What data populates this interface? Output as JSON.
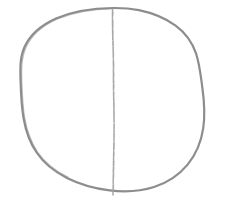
{
  "figure": {
    "background_color": "#ffffff",
    "width": 227,
    "height": 210
  },
  "strokes": {
    "outline": {
      "name": "circle-outline",
      "color": "#878787",
      "width": 2.2,
      "opacity": 0.95,
      "path": "M 113.0 8.0 C 92.0 8.2 72.0 11.5 56.0 18.5 C 41.0 25.2 30.0 35.0 24.5 47.0 C 19.6 57.8 20.2 70.0 20.6 82.0 C 21.0 94.5 21.6 107.0 23.6 118.5 C 25.8 131.0 29.8 142.5 36.6 152.5 C 44.0 163.4 54.6 171.8 67.0 178.0 C 79.8 184.4 94.4 188.6 109.6 190.4 C 124.8 192.2 140.2 191.4 154.0 187.0 C 167.4 182.8 179.0 175.0 187.6 164.6 C 196.0 154.4 201.2 141.8 203.2 128.4 C 205.2 115.0 204.2 101.0 202.4 88.0 C 200.7 75.6 199.6 64.0 196.0 53.4 C 192.2 42.2 185.4 32.8 175.6 25.6 C 165.4 18.2 152.4 13.0 139.0 10.2 C 130.6 8.5 121.8 7.9 113.0 8.0 Z"
    },
    "outline_overdraw": {
      "name": "circle-outline-overdraw",
      "color": "#8d8d8d",
      "width": 1.3,
      "opacity": 0.55,
      "path": "M 113.0 8.6 C 93.0 9.0 73.5 12.2 57.5 19.0 C 42.5 25.6 31.4 35.4 26.0 47.4 C 21.2 58.0 21.4 70.2 21.8 82.2 C 22.2 94.6 22.8 107.2 24.8 118.6 C 27.0 131.0 31.0 142.2 37.6 152.0 C 45.0 162.8 55.6 171.0 67.8 177.2"
    },
    "divider": {
      "name": "vertical-diameter-line",
      "color": "#9e9e9e",
      "width": 1.5,
      "opacity": 0.9,
      "path": "M 112.6 9.0 C 112.2 24.0 112.8 38.0 113.2 52.0 C 113.6 66.0 113.3 80.0 113.6 94.0 C 113.9 108.0 114.2 122.0 114.0 136.0 C 113.8 150.0 113.4 164.0 113.3 176.0 C 113.2 184.0 113.1 189.5 113.0 195.0",
      "dash_pattern": "9 1.4 6 1.2 13 1.6 5 1.1 11 1.5 7 1.3 15 1.2 6 1.4"
    },
    "divider_texture": {
      "name": "vertical-diameter-texture",
      "color": "#b0b0b0",
      "width": 1.1,
      "opacity": 0.5,
      "path": "M 113.4 12.0 C 113.0 28.0 113.6 44.0 113.9 60.0 C 114.2 76.0 113.9 92.0 114.2 108.0 C 114.5 124.0 114.6 140.0 114.3 156.0 C 114.1 168.0 113.8 180.0 113.6 192.0",
      "dash_pattern": "3 5 7 4 2 6 9 3 4 7 6 5"
    }
  },
  "annotations": {
    "alt_text": "A freehand pencil sketch of a roughly circular shape divided by a single vertical line running from the top of the circle to just below its bottom edge."
  }
}
